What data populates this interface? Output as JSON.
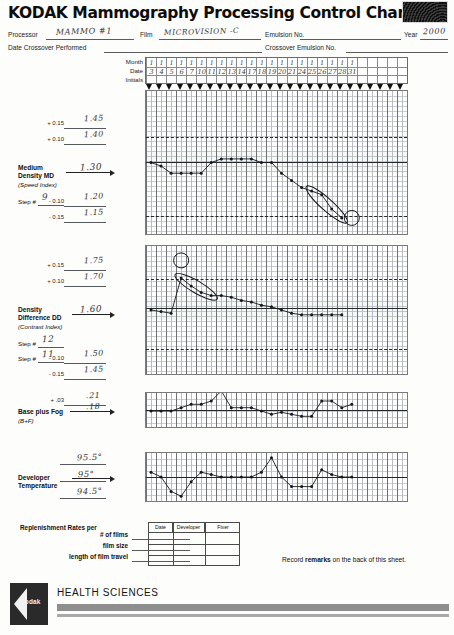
{
  "document": {
    "title": "KODAK Mammography Processing Control Chart",
    "logo_icon": "kodak-swirl-icon"
  },
  "header": {
    "fields": [
      {
        "label": "Processor",
        "value": "MAMMO #1"
      },
      {
        "label": "Film",
        "value": "MICROVISION -C"
      },
      {
        "label": "Emulsion No.",
        "value": ""
      },
      {
        "label": "Year",
        "value": "2000"
      },
      {
        "label": "Date Crossover Performed",
        "value": ""
      },
      {
        "label": "Crossover Emulsion No.",
        "value": ""
      }
    ]
  },
  "date_header": {
    "row_labels": [
      "Month",
      "Date",
      "Initials"
    ],
    "months": [
      "1",
      "1",
      "1",
      "1",
      "1",
      "1",
      "1",
      "1",
      "1",
      "1",
      "1",
      "1",
      "1",
      "1",
      "1",
      "1",
      "1",
      "1",
      "1",
      "1",
      "1"
    ],
    "dates": [
      "3",
      "4",
      "5",
      "6",
      "7",
      "10",
      "11",
      "12",
      "13",
      "14",
      "17",
      "18",
      "19",
      "20",
      "21",
      "24",
      "25",
      "26",
      "27",
      "28",
      "31"
    ],
    "initials": [
      "",
      "",
      "",
      "",
      "",
      "",
      "",
      "",
      "",
      "",
      "",
      "",
      "",
      "",
      "",
      "",
      "",
      "",
      "",
      "",
      ""
    ],
    "total_columns": 26
  },
  "panels": [
    {
      "id": "md",
      "name": "Medium Density MD",
      "name_line1": "Medium",
      "name_line2": "Density MD",
      "subtitle": "(Speed Index)",
      "aim_value": "1.30",
      "step_label": "Step #",
      "step_value": "9",
      "ticks": [
        {
          "label": "+ 0.15",
          "value": "1.45"
        },
        {
          "label": "+ 0.10",
          "value": "1.40"
        },
        {
          "label": "- 0.10",
          "value": "1.20"
        },
        {
          "label": "- 0.15",
          "value": "1.15"
        }
      ]
    },
    {
      "id": "dd",
      "name": "Density Difference DD",
      "name_line1": "Density",
      "name_line2": "Difference DD",
      "subtitle": "(Contrast Index)",
      "aim_value": "1.60",
      "step_label": "Step #",
      "step_value": "12",
      "step_label2": "Step #",
      "step_value2": "11",
      "ticks": [
        {
          "label": "+ 0.15",
          "value": "1.75"
        },
        {
          "label": "+ 0.10",
          "value": "1.70"
        },
        {
          "label": "- 0.10",
          "value": "1.50"
        },
        {
          "label": "- 0.15",
          "value": "1.45"
        }
      ]
    },
    {
      "id": "bf",
      "name": "Base plus Fog",
      "name_line1": "Base plus Fog",
      "subtitle": "(B+F)",
      "aim_value": ".18",
      "ticks": [
        {
          "label": "+ .03",
          "value": ".21"
        }
      ]
    },
    {
      "id": "temp",
      "name": "Developer Temperature",
      "name_line1": "Developer",
      "name_line2": "Temperature",
      "aim_value": "95°",
      "ticks": [
        {
          "label": "",
          "value": "95.5°"
        },
        {
          "label": "",
          "value": "94.5°"
        }
      ]
    }
  ],
  "chart_data": [
    {
      "type": "line",
      "title": "Medium Density MD (Speed Index)",
      "xlabel": "Date",
      "ylabel": "Medium Density MD",
      "categories": [
        "3",
        "4",
        "5",
        "6",
        "7",
        "10",
        "11",
        "12",
        "13",
        "14",
        "17",
        "18",
        "19",
        "20",
        "21",
        "24",
        "25",
        "26",
        "27",
        "28",
        "31"
      ],
      "values": [
        1.3,
        1.29,
        1.27,
        1.27,
        1.27,
        1.27,
        1.3,
        1.31,
        1.31,
        1.31,
        1.31,
        1.3,
        1.3,
        1.27,
        1.25,
        1.23,
        1.22,
        1.21,
        1.17,
        1.145,
        null,
        null
      ],
      "ylim": [
        1.1,
        1.5
      ],
      "reference_lines": {
        "aim": 1.3,
        "upper": 1.4,
        "lower": 1.2
      },
      "annotations": [
        {
          "kind": "ellipse",
          "note": "trending-down-run",
          "from_index": 16,
          "to_index": 19
        },
        {
          "kind": "circle",
          "note": "out-of-control-point",
          "index": 20,
          "value": 1.145
        }
      ]
    },
    {
      "type": "line",
      "title": "Density Difference DD (Contrast Index)",
      "xlabel": "Date",
      "ylabel": "Density Difference DD",
      "categories": [
        "3",
        "4",
        "5",
        "6",
        "7",
        "10",
        "11",
        "12",
        "13",
        "14",
        "17",
        "18",
        "19",
        "20",
        "21",
        "24",
        "25",
        "26",
        "27",
        "28",
        "31"
      ],
      "values": [
        1.6,
        1.595,
        1.59,
        1.7,
        1.675,
        1.655,
        1.645,
        1.645,
        1.64,
        1.63,
        1.625,
        1.615,
        1.61,
        1.6,
        1.59,
        1.585,
        1.585,
        1.585,
        1.585,
        1.585,
        null
      ],
      "ylim": [
        1.4,
        1.8
      ],
      "reference_lines": {
        "aim": 1.6,
        "upper": 1.7,
        "lower": 1.5
      },
      "annotations": [
        {
          "kind": "circle",
          "note": "outlier-high",
          "index": 3,
          "value": 1.755
        },
        {
          "kind": "ellipse",
          "note": "high-run",
          "from_index": 3,
          "to_index": 6
        }
      ]
    },
    {
      "type": "line",
      "title": "Base plus Fog (B+F)",
      "xlabel": "Date",
      "ylabel": "Base plus Fog",
      "categories": [
        "3",
        "4",
        "5",
        "6",
        "7",
        "10",
        "11",
        "12",
        "13",
        "14",
        "17",
        "18",
        "19",
        "20",
        "21",
        "24",
        "25",
        "26",
        "27",
        "28",
        "31"
      ],
      "values": [
        0.18,
        0.18,
        0.18,
        0.185,
        0.19,
        0.19,
        0.195,
        0.21,
        0.185,
        0.185,
        0.185,
        0.18,
        0.175,
        0.178,
        0.175,
        0.172,
        0.172,
        0.195,
        0.195,
        0.185,
        0.19
      ],
      "ylim": [
        0.15,
        0.21
      ],
      "reference_lines": {
        "aim": 0.18,
        "upper": 0.21
      }
    },
    {
      "type": "line",
      "title": "Developer Temperature",
      "xlabel": "Date",
      "ylabel": "Developer Temperature (°F)",
      "categories": [
        "3",
        "4",
        "5",
        "6",
        "7",
        "10",
        "11",
        "12",
        "13",
        "14",
        "17",
        "18",
        "19",
        "20",
        "21",
        "24",
        "25",
        "26",
        "27",
        "28",
        "31"
      ],
      "values": [
        95.1,
        95.0,
        94.7,
        94.6,
        94.9,
        95.1,
        95.05,
        95.0,
        95.0,
        95.0,
        95.0,
        95.1,
        95.4,
        95.0,
        94.8,
        94.8,
        94.8,
        95.15,
        95.05,
        95.0,
        95.0
      ],
      "ylim": [
        94.5,
        95.5
      ],
      "reference_lines": {
        "aim": 95.0,
        "upper": 95.5,
        "lower": 94.5
      }
    }
  ],
  "replenishment": {
    "heading": "Replenishment Rates per",
    "rows": [
      "# of films",
      "film size",
      "length of film travel"
    ],
    "table_headers": [
      "Date",
      "Developer",
      "Fixer"
    ],
    "table_rows": [
      [
        "",
        "",
        ""
      ],
      [
        "",
        "",
        ""
      ],
      [
        "",
        "",
        ""
      ]
    ]
  },
  "remarks": {
    "prefix": "Record ",
    "bold": "remarks",
    "suffix": " on the back of this sheet."
  },
  "footer": {
    "brand": "Kodak",
    "division": "HEALTH SCIENCES"
  }
}
